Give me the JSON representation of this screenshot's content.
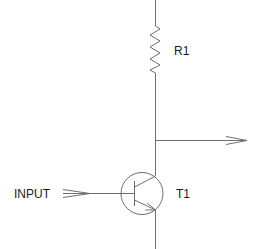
{
  "diagram": {
    "type": "circuit-schematic",
    "components": [
      {
        "id": "R1",
        "kind": "resistor",
        "label": "R1"
      },
      {
        "id": "T1",
        "kind": "npn-transistor",
        "label": "T1"
      }
    ],
    "ports": [
      {
        "id": "input",
        "label": "INPUT",
        "direction": "in"
      },
      {
        "id": "output",
        "label": "",
        "direction": "out"
      }
    ],
    "colors": {
      "wire": "#6e6e6e",
      "text": "#1a1a1a",
      "background": "#ffffff"
    }
  }
}
